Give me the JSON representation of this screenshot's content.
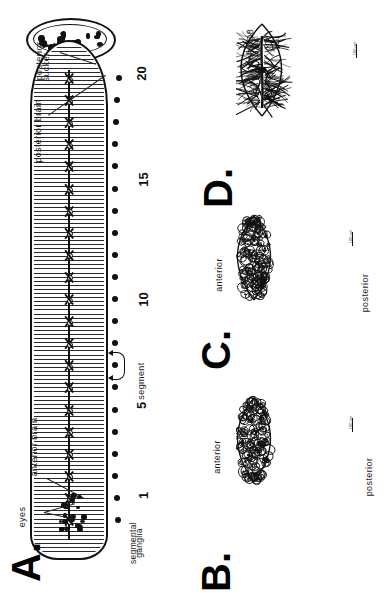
{
  "figure": {
    "type": "scientific-figure",
    "orientation": "rotated-90-ccw",
    "panels": [
      "A.",
      "B.",
      "C.",
      "D."
    ]
  },
  "panelA": {
    "letter": "A.",
    "title": "leech whole-body nervous system schematic",
    "labels": {
      "posterior_sucker": "posterior\nsucker",
      "posterior_sucker_l1": "posterior",
      "posterior_sucker_l2": "sucker",
      "posterior_brain": "posterior  brain",
      "anterior_brain": "anterior  brain",
      "eyes": "eyes",
      "segment": "segment",
      "segmental_ganglia_l1": "segmental",
      "segmental_ganglia_l2": "ganglia"
    },
    "scale_numbers": [
      "1",
      "5",
      "10",
      "15",
      "20"
    ],
    "ganglion_count": 21
  },
  "panelB": {
    "letter": "B.",
    "title": "ganglion cell map - dorsal aspect",
    "labels": {
      "anterior": "anterior",
      "posterior": "posterior"
    },
    "scale_label": "100 µm"
  },
  "panelC": {
    "letter": "C.",
    "title": "ganglion cell map - ventral aspect",
    "labels": {
      "anterior": "anterior",
      "posterior": "posterior"
    },
    "scale_label": "100 µm"
  },
  "panelD": {
    "letter": "D.",
    "title": "cell 208",
    "labels": {
      "cell_name": "cell 2O8"
    },
    "scale_label": "100 µm"
  },
  "colors": {
    "ink": "#111111",
    "paper": "#ffffff",
    "label": "#1a1a1a"
  }
}
